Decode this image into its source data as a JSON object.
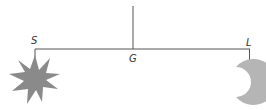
{
  "diagram": {
    "type": "balance-mobile",
    "labels": {
      "left": "S",
      "center": "G",
      "right": "L"
    },
    "objects": {
      "left": "sun-star",
      "right": "crescent-moon"
    },
    "colors": {
      "line": "#555555",
      "sun": "#8a8a8a",
      "moon": "#b5b5b5"
    }
  }
}
